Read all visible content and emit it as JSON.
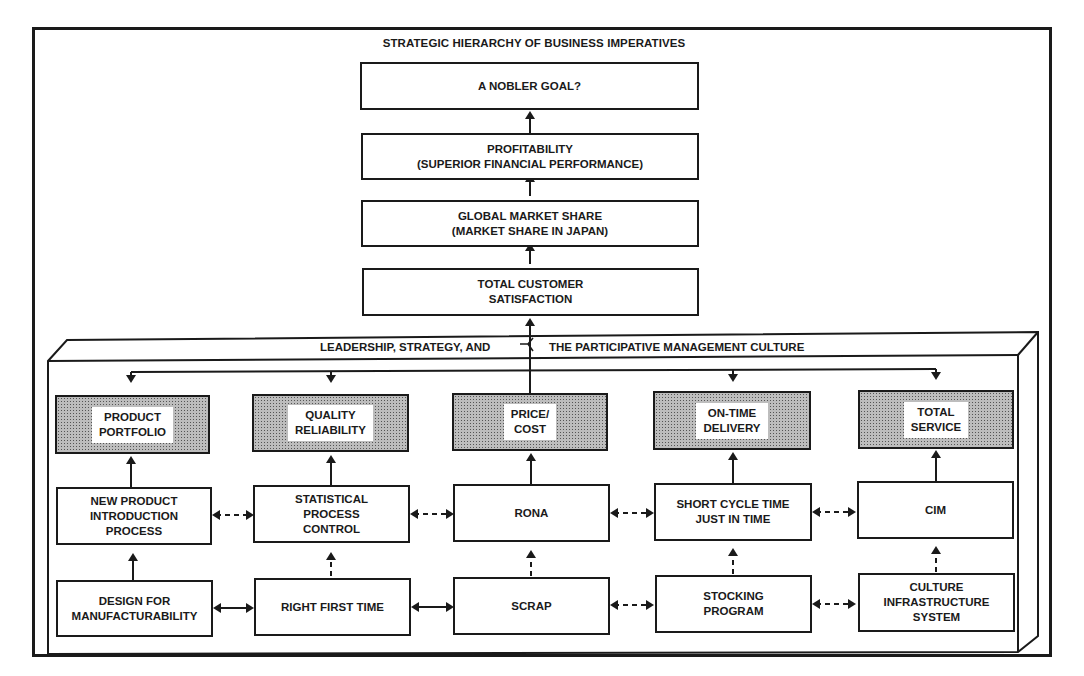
{
  "title": "STRATEGIC HIERARCHY OF BUSINESS IMPERATIVES",
  "hierarchy": [
    {
      "id": "nobler-goal",
      "label": "A NOBLER GOAL?"
    },
    {
      "id": "profitability",
      "label": "PROFITABILITY\n(SUPERIOR FINANCIAL PERFORMANCE)"
    },
    {
      "id": "global-market-share",
      "label": "GLOBAL MARKET SHARE\n(MARKET SHARE IN JAPAN)"
    },
    {
      "id": "total-customer-satisfaction",
      "label": "TOTAL CUSTOMER\nSATISFACTION"
    }
  ],
  "panel": {
    "label_left": "LEADERSHIP, STRATEGY, AND",
    "label_right": "THE PARTICIPATIVE MANAGEMENT CULTURE"
  },
  "imperatives": [
    {
      "id": "product-portfolio",
      "label": "PRODUCT\nPORTFOLIO"
    },
    {
      "id": "quality-reliability",
      "label": "QUALITY\nRELIABILITY"
    },
    {
      "id": "price-cost",
      "label": "PRICE/\nCOST"
    },
    {
      "id": "on-time-delivery",
      "label": "ON-TIME\nDELIVERY"
    },
    {
      "id": "total-service",
      "label": "TOTAL\nSERVICE"
    }
  ],
  "processes": [
    {
      "id": "new-product-introduction",
      "label": "NEW PRODUCT\nINTRODUCTION\nPROCESS"
    },
    {
      "id": "statistical-process-control",
      "label": "STATISTICAL\nPROCESS\nCONTROL"
    },
    {
      "id": "rona",
      "label": "RONA"
    },
    {
      "id": "short-cycle-time",
      "label": "SHORT CYCLE TIME\nJUST IN TIME"
    },
    {
      "id": "cim",
      "label": "CIM"
    }
  ],
  "foundations": [
    {
      "id": "design-for-manufacturability",
      "label": "DESIGN FOR\nMANUFACTURABILITY"
    },
    {
      "id": "right-first-time",
      "label": "RIGHT FIRST TIME"
    },
    {
      "id": "scrap",
      "label": "SCRAP"
    },
    {
      "id": "stocking-program",
      "label": "STOCKING\nPROGRAM"
    },
    {
      "id": "culture-infrastructure-system",
      "label": "CULTURE\nINFRASTRUCTURE\nSYSTEM"
    }
  ],
  "colors": {
    "ink": "#1a1a1a",
    "shade": "#bdbdbd",
    "background": "#ffffff"
  }
}
